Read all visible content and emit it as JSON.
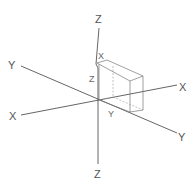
{
  "diagram": {
    "axes": {
      "z_top_label": "Z",
      "z_bottom_label": "Z",
      "y_left_label": "Y",
      "y_right_label": "Y",
      "x_left_label": "X",
      "x_right_label": "X"
    },
    "box_labels": {
      "x_label": "X",
      "z_label": "Z",
      "y_label": "Y"
    },
    "colors": {
      "line": "#555555",
      "box": "#777777",
      "background": "#ffffff"
    }
  }
}
